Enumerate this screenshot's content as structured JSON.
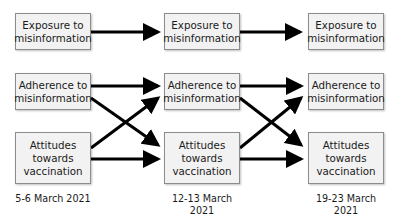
{
  "diagram": {
    "type": "cross-lagged panel model",
    "columns": [
      {
        "date": "5-6 March 2021",
        "nodes": [
          "Exposure to misinformation",
          "Adherence to misinformation",
          "Attitudes towards vaccination"
        ]
      },
      {
        "date": "12-13 March 2021",
        "nodes": [
          "Exposure to misinformation",
          "Adherence to misinformation",
          "Attitudes towards vaccination"
        ]
      },
      {
        "date": "19-23 March 2021",
        "nodes": [
          "Exposure to misinformation",
          "Adherence to misinformation",
          "Attitudes towards vaccination"
        ]
      }
    ],
    "edges": [
      {
        "from": "c1.exposure",
        "to": "c2.exposure"
      },
      {
        "from": "c2.exposure",
        "to": "c3.exposure"
      },
      {
        "from": "c1.adherence",
        "to": "c2.adherence"
      },
      {
        "from": "c1.adherence",
        "to": "c2.attitudes"
      },
      {
        "from": "c1.attitudes",
        "to": "c2.adherence"
      },
      {
        "from": "c1.attitudes",
        "to": "c2.attitudes"
      },
      {
        "from": "c2.adherence",
        "to": "c3.adherence"
      },
      {
        "from": "c2.adherence",
        "to": "c3.attitudes"
      },
      {
        "from": "c2.attitudes",
        "to": "c3.adherence"
      },
      {
        "from": "c2.attitudes",
        "to": "c3.attitudes"
      }
    ],
    "colors": {
      "box_fill": "#f2f2f2",
      "box_border": "#8c8c8c",
      "arrow": "#000000"
    }
  }
}
